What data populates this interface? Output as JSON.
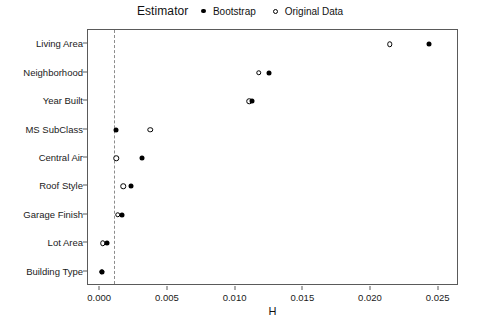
{
  "legend": {
    "title": "Estimator",
    "items": [
      {
        "label": "Bootstrap",
        "glyph": "filled-dot-icon"
      },
      {
        "label": "Original Data",
        "glyph": "open-circle-icon"
      }
    ]
  },
  "axis": {
    "x_title": "H",
    "x_ticks": [
      "0.000",
      "0.005",
      "0.010",
      "0.015",
      "0.020",
      "0.025"
    ],
    "y_ticks": [
      "Living Area",
      "Neighborhood",
      "Year Built",
      "MS SubClass",
      "Central Air",
      "Roof Style",
      "Garage Finish",
      "Lot Area",
      "Building Type"
    ]
  },
  "reference_line": {
    "value": 0.001
  },
  "chart_data": {
    "type": "scatter",
    "title": "",
    "subtitle": "",
    "xlabel": "H",
    "ylabel": "",
    "xlim": [
      -0.0009,
      0.0265
    ],
    "xticks": [
      0.0,
      0.005,
      0.01,
      0.015,
      0.02,
      0.025
    ],
    "xticklabels": [
      "0.000",
      "0.005",
      "0.010",
      "0.015",
      "0.020",
      "0.025"
    ],
    "grid": false,
    "legend_position": "top-center",
    "legend_title": "Estimator",
    "categories": [
      "Living Area",
      "Neighborhood",
      "Year Built",
      "MS SubClass",
      "Central Air",
      "Roof Style",
      "Garage Finish",
      "Lot Area",
      "Building Type"
    ],
    "series": [
      {
        "name": "Bootstrap",
        "marker": "filled-circle",
        "color": "#000000",
        "values": [
          0.0243,
          0.0125,
          0.0112,
          0.0012,
          0.0031,
          0.0023,
          0.0016,
          0.0005,
          0.0001
        ]
      },
      {
        "name": "Original Data",
        "marker": "open-circle",
        "color": "#000000",
        "values": [
          0.0214,
          0.0117,
          0.011,
          0.0037,
          0.0012,
          0.0017,
          0.0013,
          0.0002,
          0.0001
        ]
      }
    ],
    "annotations": [
      {
        "type": "vline",
        "x": 0.001,
        "style": "dashed",
        "color": "#8c8c8c"
      }
    ]
  }
}
